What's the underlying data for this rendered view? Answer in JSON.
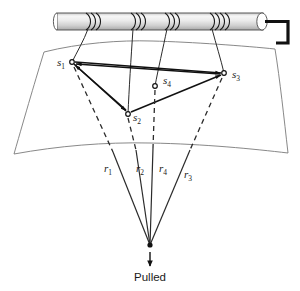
{
  "figure": {
    "background_color": "#ffffff",
    "line_color": "#1a1a1a",
    "surface_color": "#7a7a7a"
  },
  "rod": {
    "name": "coil-rod",
    "fill_light": "#f2f2f2",
    "fill_mid": "#d8d8d8",
    "coil_count": 4,
    "coil_positions_x": [
      88,
      133,
      167,
      212
    ],
    "x_start": 57,
    "x_end": 263,
    "y_top": 13,
    "y_bottom": 30
  },
  "terminal": {
    "name": "terminal-lead",
    "color": "#111111"
  },
  "nodes": [
    {
      "id": "s1",
      "label": "s",
      "sub": "1",
      "x": 72,
      "y": 62,
      "label_x": 57,
      "label_y": 66
    },
    {
      "id": "s2",
      "label": "s",
      "sub": "2",
      "x": 128,
      "y": 114,
      "label_x": 133,
      "label_y": 121
    },
    {
      "id": "s3",
      "label": "s",
      "sub": "3",
      "x": 224,
      "y": 73,
      "label_x": 232,
      "label_y": 78
    },
    {
      "id": "s4",
      "label": "s",
      "sub": "4",
      "x": 155,
      "y": 86,
      "label_x": 163,
      "label_y": 84
    }
  ],
  "rays": [
    {
      "id": "r1",
      "label": "r",
      "sub": "1",
      "from": "s1",
      "label_x": 104,
      "label_y": 172
    },
    {
      "id": "r2",
      "label": "r",
      "sub": "2",
      "from": "s2",
      "label_x": 136,
      "label_y": 172
    },
    {
      "id": "r4",
      "label": "r",
      "sub": "4",
      "from": "s4",
      "label_x": 159,
      "label_y": 172
    },
    {
      "id": "r3",
      "label": "r",
      "sub": "3",
      "from": "s3",
      "label_x": 184,
      "label_y": 178
    }
  ],
  "pull": {
    "point_x": 150,
    "point_y": 245,
    "caption": "Pulled",
    "caption_x": 150,
    "caption_y": 281,
    "arrow_from_y": 252,
    "arrow_to_y": 266
  },
  "mesh_edges": [
    {
      "from": "s1",
      "to": "s3"
    },
    {
      "from": "s1",
      "to": "s2"
    },
    {
      "from": "s2",
      "to": "s3"
    },
    {
      "from": "s2",
      "to": "s1"
    },
    {
      "from": "s3",
      "to": "s1"
    }
  ]
}
